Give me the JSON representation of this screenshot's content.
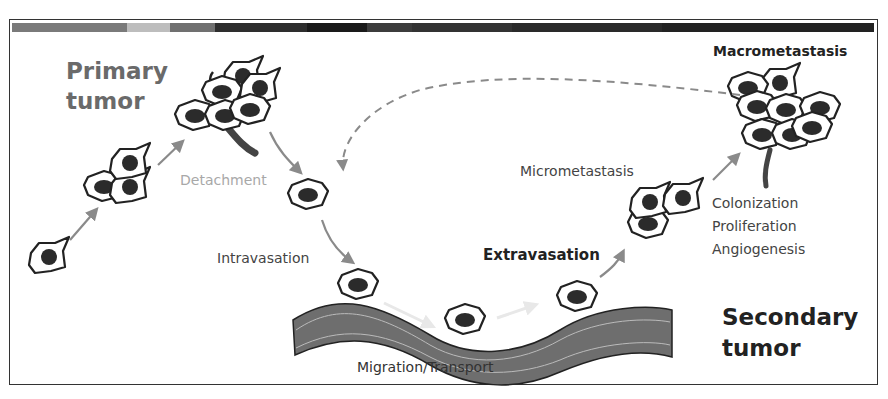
{
  "diagram": {
    "title_bar_colors": [
      "#7a7a7a",
      "#bdbdbd",
      "#707070",
      "#2e2e2e",
      "#1a1a1a",
      "#3c3c3c",
      "#222222"
    ],
    "stages": {
      "primary_tumor": "Primary tumor",
      "primary_line1": "Primary",
      "primary_line2": "tumor",
      "detachment": "Detachment",
      "intravasation": "Intravasation",
      "migration": "Migration/Transport",
      "extravasation": "Extravasation",
      "micrometastasis": "Micrometastasis",
      "macrometastasis": "Macrometastasis",
      "colonization": "Colonization",
      "proliferation": "Proliferation",
      "angiogenesis": "Angiogenesis",
      "secondary_line1": "Secondary",
      "secondary_line2": "tumor"
    },
    "colors": {
      "arrow": "#8a8a8a",
      "vessel": "#6e6e6e",
      "nucleus": "#2b2b2b",
      "detachment_text": "#a8a8a8",
      "primary_text": "#6a6a6a"
    }
  }
}
